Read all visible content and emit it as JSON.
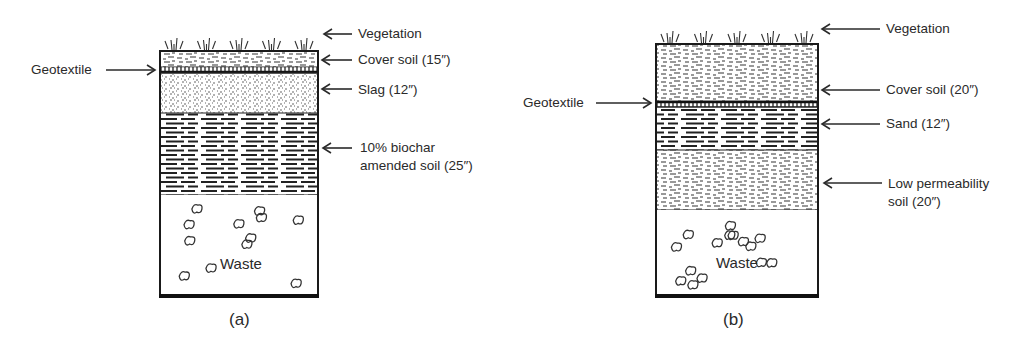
{
  "figures": [
    {
      "id": "a",
      "caption": "(a)",
      "box": {
        "x": 160,
        "y": 51,
        "w": 158,
        "h": 245
      },
      "layers": [
        {
          "name": "cover-soil",
          "label": "Cover soil (15″)",
          "y0": 51,
          "y1": 67,
          "pattern": "speckle"
        },
        {
          "name": "geotextile",
          "label": "Geotextile",
          "y0": 67,
          "y1": 73,
          "pattern": "geotextile"
        },
        {
          "name": "slag",
          "label": "Slag (12″)",
          "y0": 73,
          "y1": 113,
          "pattern": "slag"
        },
        {
          "name": "biochar-amended-soil",
          "label": "10% biochar amended soil (25″)",
          "y0": 113,
          "y1": 195,
          "pattern": "dash"
        },
        {
          "name": "waste",
          "label": "Waste",
          "y0": 195,
          "y1": 296,
          "pattern": "waste"
        }
      ],
      "labels": {
        "vegetation": "Vegetation",
        "cover_soil": "Cover soil (15″)",
        "geotextile": "Geotextile",
        "slag": "Slag (12″)",
        "biochar_line1": "10% biochar",
        "biochar_line2": "amended soil (25″)",
        "waste": "Waste"
      }
    },
    {
      "id": "b",
      "caption": "(b)",
      "box": {
        "x": 656,
        "y": 44,
        "w": 162,
        "h": 252
      },
      "layers": [
        {
          "name": "cover-soil",
          "label": "Cover soil (20″)",
          "y0": 44,
          "y1": 101,
          "pattern": "speckle"
        },
        {
          "name": "geotextile",
          "label": "Geotextile",
          "y0": 101,
          "y1": 107,
          "pattern": "geotextile"
        },
        {
          "name": "sand",
          "label": "Sand (12″)",
          "y0": 107,
          "y1": 150,
          "pattern": "dash"
        },
        {
          "name": "low-permeability-soil",
          "label": "Low permeability soil (20″)",
          "y0": 150,
          "y1": 210,
          "pattern": "speckle"
        },
        {
          "name": "waste",
          "label": "Waste",
          "y0": 210,
          "y1": 296,
          "pattern": "waste"
        }
      ],
      "labels": {
        "vegetation": "Vegetation",
        "cover_soil": "Cover soil (20″)",
        "geotextile": "Geotextile",
        "sand": "Sand (12″)",
        "lowperm_line1": "Low permeability",
        "lowperm_line2": "soil (20″)",
        "waste": "Waste"
      }
    }
  ],
  "colors": {
    "ink": "#2a2a2a",
    "background": "#ffffff"
  }
}
